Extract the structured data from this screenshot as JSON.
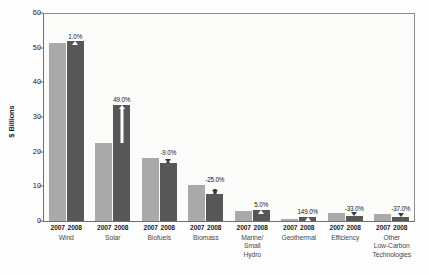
{
  "chart_data": {
    "type": "bar",
    "title": "",
    "subtitle": "",
    "xlabel": "",
    "ylabel": "$ Billions",
    "ylim": [
      0,
      60
    ],
    "yticks": [
      0,
      10,
      20,
      30,
      40,
      50,
      60
    ],
    "grid": false,
    "legend_position": "none",
    "categories": [
      "Wind",
      "Solar",
      "Biofuels",
      "Biomass",
      "Marine/\nSmall\nHydro",
      "Geothermal",
      "Efficiency",
      "Other\nLow-Carbon\nTechnologies"
    ],
    "series": [
      {
        "name": "2007",
        "values": [
          51.3,
          22.4,
          18.3,
          10.4,
          2.9,
          0.5,
          2.2,
          2.1
        ]
      },
      {
        "name": "2008",
        "values": [
          51.8,
          33.4,
          16.7,
          7.8,
          3.1,
          1.3,
          1.5,
          1.3
        ]
      }
    ],
    "annotations": [
      "1.0%",
      "49.0%",
      "-9.0%",
      "-25.0%",
      "5.0%",
      "149.0%",
      "-33.0%",
      "-37.0%"
    ],
    "colors": {
      "series_2007": "#a9a9a9",
      "series_2008": "#575757",
      "axis": "#6f6f6f",
      "text": "#1a1a1a"
    }
  },
  "axis": {
    "y_title": "$ Billions",
    "y_ticks": [
      "60",
      "50",
      "40",
      "30",
      "20",
      "10",
      "0"
    ]
  },
  "groups": [
    {
      "category": "Wind",
      "year_a": "2007",
      "year_b": "2008",
      "v2007": 51.3,
      "v2008": 51.8,
      "pct": "1.0%",
      "dir": "up"
    },
    {
      "category": "Solar",
      "year_a": "2007",
      "year_b": "2008",
      "v2007": 22.4,
      "v2008": 33.4,
      "pct": "49.0%",
      "dir": "up"
    },
    {
      "category": "Biofuels",
      "year_a": "2007",
      "year_b": "2008",
      "v2007": 18.3,
      "v2008": 16.7,
      "pct": "-9.0%",
      "dir": "down"
    },
    {
      "category": "Biomass",
      "year_a": "2007",
      "year_b": "2008",
      "v2007": 10.4,
      "v2008": 7.8,
      "pct": "-25.0%",
      "dir": "down"
    },
    {
      "category": "Marine/\nSmall\nHydro",
      "year_a": "2007",
      "year_b": "2008",
      "v2007": 2.9,
      "v2008": 3.1,
      "pct": "5.0%",
      "dir": "up"
    },
    {
      "category": "Geothermal",
      "year_a": "2007",
      "year_b": "2008",
      "v2007": 0.5,
      "v2008": 1.3,
      "pct": "149.0%",
      "dir": "up"
    },
    {
      "category": "Efficiency",
      "year_a": "2007",
      "year_b": "2008",
      "v2007": 2.2,
      "v2008": 1.5,
      "pct": "-33.0%",
      "dir": "down"
    },
    {
      "category": "Other\nLow-Carbon\nTechnologies",
      "year_a": "2007",
      "year_b": "2008",
      "v2007": 2.1,
      "v2008": 1.3,
      "pct": "-37.0%",
      "dir": "down"
    }
  ]
}
